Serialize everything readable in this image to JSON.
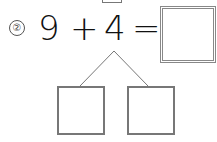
{
  "problem": {
    "number_label": "②",
    "first_operand": "9",
    "operator": "+",
    "second_operand": "4",
    "equals": "=",
    "answer": ""
  },
  "decomposition": {
    "left_value": "",
    "right_value": ""
  }
}
